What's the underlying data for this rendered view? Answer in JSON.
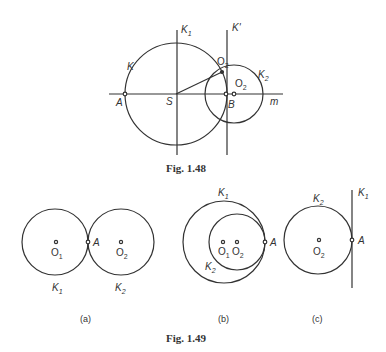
{
  "figures": [
    {
      "caption": "Fig. 1.48",
      "labels": {
        "K": "K",
        "K1": "K",
        "K1_sub": "1",
        "Kprime": "K'",
        "O2_upper": "O",
        "O2_upper_sub": "2",
        "O2_center": "O",
        "O2_center_sub": "2",
        "K2": "K",
        "K2_sub": "2",
        "A": "A",
        "S": "S",
        "B": "B",
        "m": "m"
      }
    },
    {
      "caption": "Fig. 1.49",
      "panels": [
        {
          "tag": "(a)",
          "labels": {
            "O1": "O",
            "O1_sub": "1",
            "O2": "O",
            "O2_sub": "2",
            "A": "A",
            "K1": "K",
            "K1_sub": "1",
            "K2": "K",
            "K2_sub": "2"
          }
        },
        {
          "tag": "(b)",
          "labels": {
            "K1": "K",
            "K1_sub": "1",
            "O1": "O",
            "O1_sub": "1",
            "O2": "O",
            "O2_sub": "2",
            "A": "A",
            "K2": "K",
            "K2_sub": "2"
          }
        },
        {
          "tag": "(c)",
          "labels": {
            "K2": "K",
            "K2_sub": "2",
            "K1": "K",
            "K1_sub": "1",
            "O2": "O",
            "O2_sub": "2",
            "A": "A"
          }
        }
      ]
    }
  ]
}
